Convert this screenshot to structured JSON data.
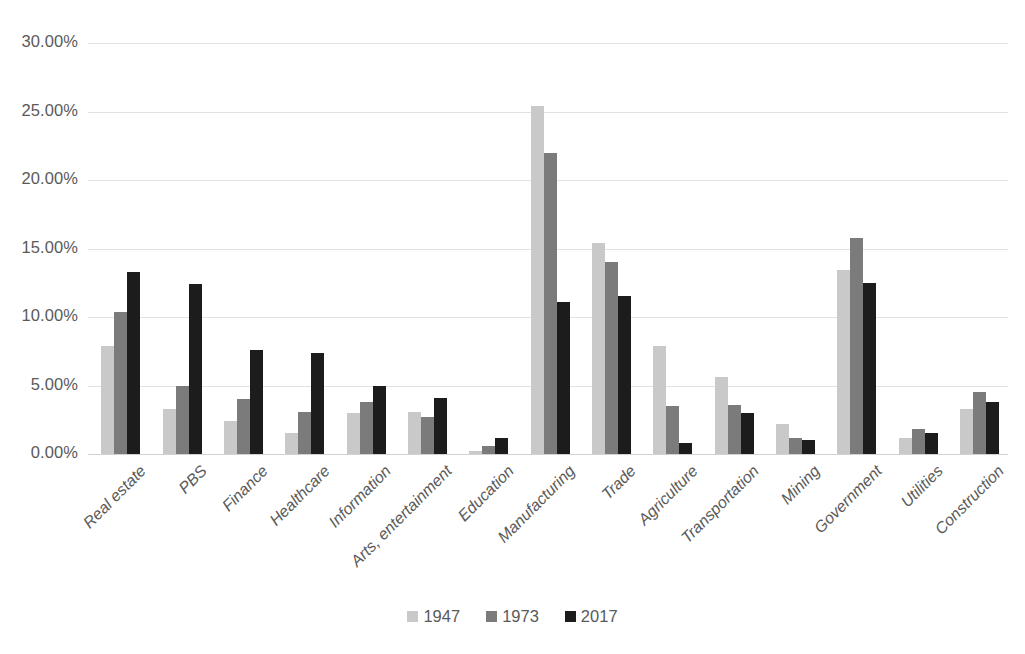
{
  "chart_data": {
    "type": "bar",
    "title": "",
    "subtitle": "",
    "xlabel": "",
    "ylabel": "",
    "ylim": [
      0,
      30
    ],
    "y_tick_labels": [
      "30.00%",
      "25.00%",
      "20.00%",
      "15.00%",
      "10.00%",
      "5.00%",
      "0.00%"
    ],
    "y_tick_values": [
      30,
      25,
      20,
      15,
      10,
      5,
      0
    ],
    "grid": "horizontal",
    "legend_position": "bottom",
    "value_suffix": "%",
    "categories": [
      "Real estate",
      "PBS",
      "Finance",
      "Healthcare",
      "Information",
      "Arts, entertainment",
      "Education",
      "Manufacturing",
      "Trade",
      "Agriculture",
      "Transportation",
      "Mining",
      "Government",
      "Utilities",
      "Construction"
    ],
    "series": [
      {
        "name": "1947",
        "color": "#c9c9c9",
        "values": [
          7.9,
          3.3,
          2.4,
          1.5,
          3.0,
          3.1,
          0.2,
          25.4,
          15.4,
          7.9,
          5.6,
          2.2,
          13.4,
          1.2,
          3.3
        ]
      },
      {
        "name": "1973",
        "color": "#7b7b7b",
        "values": [
          10.4,
          5.0,
          4.0,
          3.1,
          3.8,
          2.7,
          0.6,
          22.0,
          14.0,
          3.5,
          3.6,
          1.2,
          15.8,
          1.8,
          4.5
        ]
      },
      {
        "name": "2017",
        "color": "#1c1c1c",
        "values": [
          13.3,
          12.4,
          7.6,
          7.4,
          5.0,
          4.1,
          1.2,
          11.1,
          11.5,
          0.8,
          3.0,
          1.0,
          12.5,
          1.5,
          3.8
        ]
      }
    ]
  },
  "legend": {
    "items": [
      {
        "label": "1947",
        "color": "#c9c9c9"
      },
      {
        "label": "1973",
        "color": "#7b7b7b"
      },
      {
        "label": "2017",
        "color": "#1c1c1c"
      }
    ]
  }
}
